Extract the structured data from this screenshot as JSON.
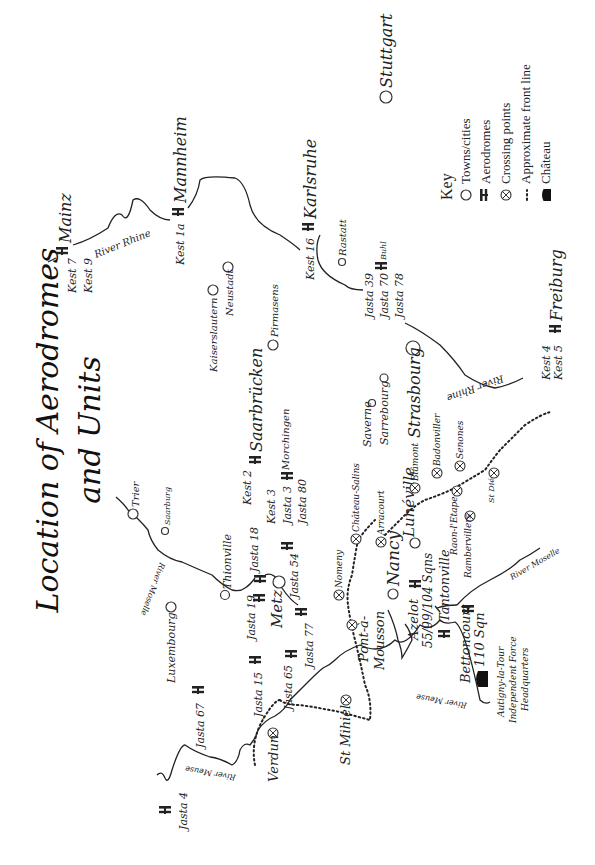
{
  "title": {
    "line1": "Location of Aerodromes",
    "line2": "and Units"
  },
  "orientation": "rotated 90° counter-clockwise (north points left)",
  "key": {
    "heading": "Key",
    "items": [
      {
        "symbol": "town-circle",
        "label": "Towns/cities"
      },
      {
        "symbol": "aerodrome-icon",
        "label": "Aerodromes"
      },
      {
        "symbol": "crossing-point-icon",
        "label": "Crossing points"
      },
      {
        "symbol": "dotted-line",
        "label": "Approximate front line"
      },
      {
        "symbol": "chateau-icon",
        "label": "Château"
      }
    ]
  },
  "towns": {
    "stuttgart": "Stuttgart",
    "rastatt": "Rastatt",
    "neustadt": "Neustadt",
    "kaiserslautern": "Kaiserslautern",
    "pirmasens": "Pirmasens",
    "strasbourg": "Strasbourg",
    "saverne": "Saverne",
    "sarrebourg": "Sarrebourg",
    "trier": "Trier",
    "saarburg": "Saarburg",
    "thionville": "Thionville",
    "luxembourg": "Luxembourg",
    "metz": "Metz",
    "nancy": "Nancy",
    "luneville": "Lunéville",
    "pont_a_mousson_1": "Pont-à-",
    "pont_a_mousson_2": "Mousson"
  },
  "aerodromes": {
    "mainz": "Mainz",
    "mainz_units": [
      "Kest 7",
      "Kest 9"
    ],
    "mannheim": "Mannheim",
    "mannheim_units": "Kest 1a",
    "karlsruhe": "Karlsruhe",
    "karlsruhe_units": "Kest 16",
    "buhl": "Buhl",
    "buhl_units": [
      "Jasta 39",
      "Jasta 70",
      "Jasta 78"
    ],
    "freiburg": "Freiburg",
    "freiburg_units": [
      "Kest 4",
      "Kest 5"
    ],
    "saarbrucken": "Saarbrücken",
    "saarbrucken_units": "Kest 2",
    "morchingen": "Morchingen",
    "morchingen_units": [
      "Kest 3",
      "Jasta 3",
      "Jasta 80"
    ],
    "jasta18": "Jasta 18",
    "jasta19": "Jasta 19",
    "jasta54": "Jasta 54",
    "jasta77": "Jasta 77",
    "jasta65": "Jasta 65",
    "jasta15": "Jasta 15",
    "jasta67": "Jasta 67",
    "jasta4": "Jasta 4",
    "azelot": "Azelot",
    "azelot_units": "55/99/104 Sqns",
    "tantonville": "Tantonville",
    "bettoncourt": "Bettoncourt",
    "bettoncourt_units": "110 Sqn"
  },
  "crossing_points": {
    "verdun": "Verdun",
    "st_mihiel": "St Mihiel",
    "nomeny": "Nomeny",
    "chateau_salins": "Château-Salins",
    "arracourt": "Arracourt",
    "blamont": "Blâmont",
    "badonviller": "Badonviller",
    "senones": "Senones",
    "raon_l_etape": "Raon-l'Etape",
    "rambervillers": "Rambervillers",
    "st_die": "St Dié"
  },
  "chateau": {
    "name": "Autigny-la-Tour",
    "line2": "Independent Force",
    "line3": "Headquarters"
  },
  "rivers": {
    "rhine_north": "River Rhine",
    "rhine_south": "River Rhine",
    "moselle_north": "River Moselle",
    "moselle_south": "River Moselle",
    "meuse_north": "River Meuse",
    "meuse_south": "River Meuse"
  }
}
